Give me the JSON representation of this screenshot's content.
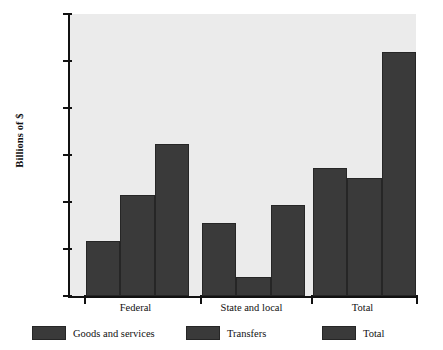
{
  "chart_data": {
    "type": "bar",
    "title": "",
    "xlabel": "",
    "ylabel": "Billions of $",
    "ylim": [
      0,
      3000
    ],
    "ytick_labels": [
      "0",
      "500",
      "1,000",
      "1,500",
      "2,000",
      "2,500",
      "3,000"
    ],
    "ytick_values": [
      0,
      500,
      1000,
      1500,
      2000,
      2500,
      3000
    ],
    "grid": false,
    "legend_position": "bottom",
    "categories": [
      "Federal",
      "State and local",
      "Total"
    ],
    "series": [
      {
        "name": "Goods and services",
        "values": [
          580,
          780,
          1360
        ],
        "color": "#3a3a3a"
      },
      {
        "name": "Transfers",
        "values": [
          1070,
          200,
          1260
        ],
        "color": "#3a3a3a"
      },
      {
        "name": "Total",
        "values": [
          1620,
          970,
          2600
        ],
        "color": "#3a3a3a"
      }
    ]
  },
  "colors": {
    "bar_fill": "#3a3a3a",
    "bar_edge": "#262626",
    "plot_background": "#ebebeb",
    "axis": "#111111",
    "page_background": "#ffffff"
  }
}
